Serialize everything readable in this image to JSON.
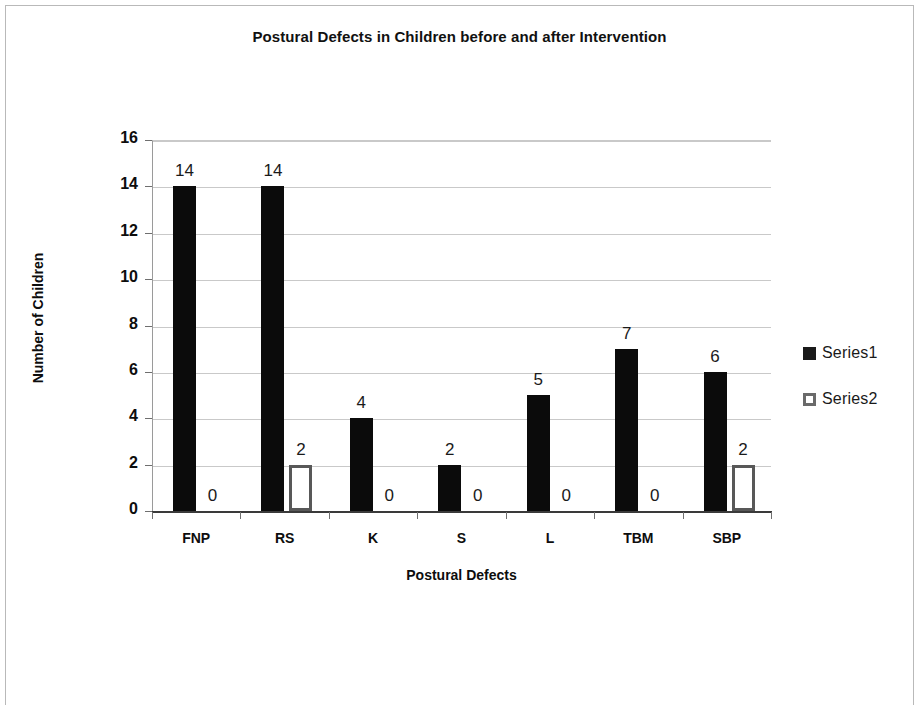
{
  "chart_data": {
    "type": "bar",
    "title": "Postural Defects in Children before and after Intervention",
    "xlabel": "Postural Defects",
    "ylabel": "Number of Children",
    "categories": [
      "FNP",
      "RS",
      "K",
      "S",
      "L",
      "TBM",
      "SBP"
    ],
    "series": [
      {
        "name": "Series1",
        "values": [
          14,
          14,
          4,
          2,
          5,
          7,
          6
        ],
        "color": "#0b0b0b",
        "style": "filled"
      },
      {
        "name": "Series2",
        "values": [
          0,
          2,
          0,
          0,
          0,
          0,
          2
        ],
        "color": "#585858",
        "style": "outlined"
      }
    ],
    "ylim": [
      0,
      16
    ],
    "yticks": [
      0,
      2,
      4,
      6,
      8,
      10,
      12,
      14,
      16
    ],
    "ytick_labels": [
      "0",
      "2",
      "4",
      "6",
      "8",
      "10",
      "12",
      "14",
      "16"
    ],
    "data_labels": true,
    "grid": "horizontal",
    "legend_position": "right"
  },
  "legend": {
    "entries": [
      {
        "label": "Series1"
      },
      {
        "label": "Series2"
      }
    ]
  }
}
